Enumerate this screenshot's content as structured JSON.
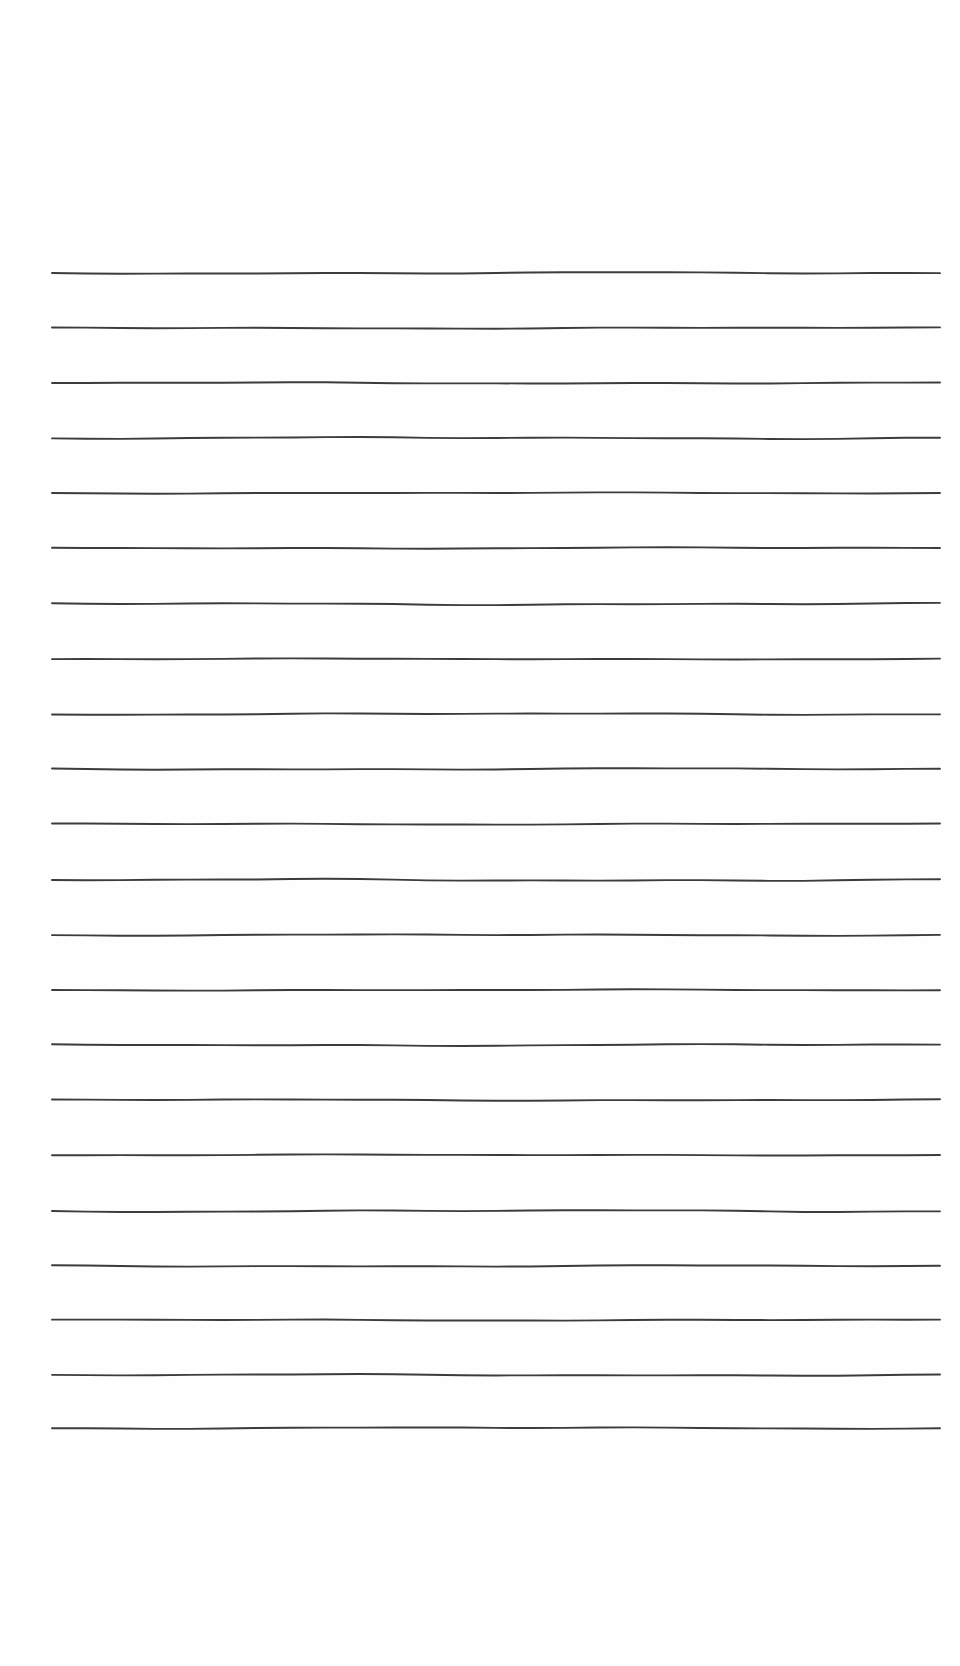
{
  "document": {
    "kind": "lined-notepaper",
    "title": "Blank Ruled Notepaper Sheet",
    "page_background_color": "#ffffff",
    "sheet_color": "#fefefe",
    "width_px": 960,
    "height_px": 1666,
    "visible_text": "",
    "note": ""
  },
  "ruling": {
    "line_color": "#3c3c3c",
    "line_count": 22,
    "line_thickness_px": 1.9,
    "line_spacing_px": 55,
    "first_line_y_px": 273,
    "last_line_y_px": 1428,
    "line_start_x_px": 52,
    "line_end_x_px": 940,
    "style": "hand-drawn-wavy",
    "lines": [
      {
        "index": 1,
        "y": 273,
        "x_start": 52,
        "x_end": 940,
        "wave": 1.2
      },
      {
        "index": 2,
        "y": 328,
        "x_start": 52,
        "x_end": 940,
        "wave": -0.9
      },
      {
        "index": 3,
        "y": 383,
        "x_start": 52,
        "x_end": 940,
        "wave": 1.0
      },
      {
        "index": 4,
        "y": 438,
        "x_start": 52,
        "x_end": 940,
        "wave": -1.3
      },
      {
        "index": 5,
        "y": 493,
        "x_start": 52,
        "x_end": 940,
        "wave": 0.8
      },
      {
        "index": 6,
        "y": 548,
        "x_start": 52,
        "x_end": 940,
        "wave": -1.0
      },
      {
        "index": 7,
        "y": 604,
        "x_start": 52,
        "x_end": 940,
        "wave": 1.4
      },
      {
        "index": 8,
        "y": 659,
        "x_start": 52,
        "x_end": 940,
        "wave": -0.7
      },
      {
        "index": 9,
        "y": 714,
        "x_start": 52,
        "x_end": 940,
        "wave": 1.1
      },
      {
        "index": 10,
        "y": 769,
        "x_start": 52,
        "x_end": 940,
        "wave": -1.2
      },
      {
        "index": 11,
        "y": 824,
        "x_start": 52,
        "x_end": 940,
        "wave": 0.9
      },
      {
        "index": 12,
        "y": 880,
        "x_start": 52,
        "x_end": 940,
        "wave": -1.5
      },
      {
        "index": 13,
        "y": 935,
        "x_start": 52,
        "x_end": 940,
        "wave": 1.0
      },
      {
        "index": 14,
        "y": 990,
        "x_start": 52,
        "x_end": 940,
        "wave": -0.8
      },
      {
        "index": 15,
        "y": 1045,
        "x_start": 52,
        "x_end": 940,
        "wave": 1.3
      },
      {
        "index": 16,
        "y": 1100,
        "x_start": 52,
        "x_end": 940,
        "wave": -1.0
      },
      {
        "index": 17,
        "y": 1155,
        "x_start": 52,
        "x_end": 940,
        "wave": 0.7
      },
      {
        "index": 18,
        "y": 1211,
        "x_start": 52,
        "x_end": 940,
        "wave": -1.4
      },
      {
        "index": 19,
        "y": 1266,
        "x_start": 52,
        "x_end": 940,
        "wave": 1.1
      },
      {
        "index": 20,
        "y": 1320,
        "x_start": 52,
        "x_end": 940,
        "wave": -0.9
      },
      {
        "index": 21,
        "y": 1375,
        "x_start": 52,
        "x_end": 940,
        "wave": 1.2
      },
      {
        "index": 22,
        "y": 1428,
        "x_start": 52,
        "x_end": 940,
        "wave": -1.1
      }
    ]
  },
  "margins": {
    "top_px": 273,
    "bottom_px": 238,
    "left_px": 52,
    "right_px": 20
  },
  "regions": {
    "top_margin_label": "",
    "bottom_margin_label": "",
    "left_margin_label": "",
    "right_margin_label": "",
    "writing_area_label": ""
  }
}
